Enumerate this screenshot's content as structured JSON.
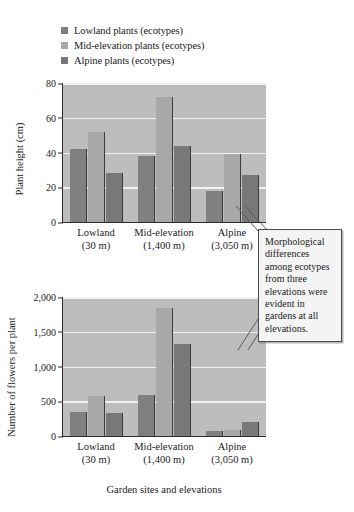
{
  "legend": {
    "items": [
      {
        "label": "Lowland plants (ecotypes)",
        "color": "#808080"
      },
      {
        "label": "Mid-elevation plants (ecotypes)",
        "color": "#a8a8a8"
      },
      {
        "label": "Alpine plants (ecotypes)",
        "color": "#787878"
      }
    ]
  },
  "axis_title": "Garden sites and elevations",
  "callout": {
    "text": "Morphological differences among ecotypes from three elevations were evident in gardens at all elevations."
  },
  "categories": [
    {
      "name": "Lowland",
      "elevation": "(30 m)"
    },
    {
      "name": "Mid-elevation",
      "elevation": "(1,400 m)"
    },
    {
      "name": "Alpine",
      "elevation": "(3,050 m)"
    }
  ],
  "chart_data": [
    {
      "type": "bar",
      "id": "plant-height",
      "title": "",
      "xlabel": "Garden sites and elevations",
      "ylabel": "Plant height (cm)",
      "categories": [
        "Lowland (30 m)",
        "Mid-elevation (1,400 m)",
        "Alpine (3,050 m)"
      ],
      "ylim": [
        0,
        80
      ],
      "yticks": [
        "0",
        "20",
        "40",
        "60",
        "80"
      ],
      "ytick_values": [
        0,
        20,
        40,
        60,
        80
      ],
      "grid": true,
      "legend_position": "above-plot",
      "series": [
        {
          "name": "Lowland plants (ecotypes)",
          "color": "#808080",
          "values": [
            42,
            38,
            18
          ]
        },
        {
          "name": "Mid-elevation plants (ecotypes)",
          "color": "#a8a8a8",
          "values": [
            52,
            72,
            39
          ]
        },
        {
          "name": "Alpine plants (ecotypes)",
          "color": "#787878",
          "values": [
            28,
            44,
            27
          ]
        }
      ]
    },
    {
      "type": "bar",
      "id": "flowers-per-plant",
      "title": "",
      "xlabel": "Garden sites and elevations",
      "ylabel": "Number of flowers per plant",
      "categories": [
        "Lowland (30 m)",
        "Mid-elevation (1,400 m)",
        "Alpine (3,050 m)"
      ],
      "ylim": [
        0,
        2000
      ],
      "yticks": [
        "0",
        "500",
        "1,000",
        "1,500",
        "2,000"
      ],
      "ytick_values": [
        0,
        500,
        1000,
        1500,
        2000
      ],
      "grid": true,
      "legend_position": "above-plot",
      "series": [
        {
          "name": "Lowland plants (ecotypes)",
          "color": "#808080",
          "values": [
            340,
            590,
            75
          ]
        },
        {
          "name": "Mid-elevation plants (ecotypes)",
          "color": "#a8a8a8",
          "values": [
            580,
            1840,
            85
          ]
        },
        {
          "name": "Alpine plants (ecotypes)",
          "color": "#787878",
          "values": [
            330,
            1330,
            195
          ]
        }
      ]
    }
  ]
}
